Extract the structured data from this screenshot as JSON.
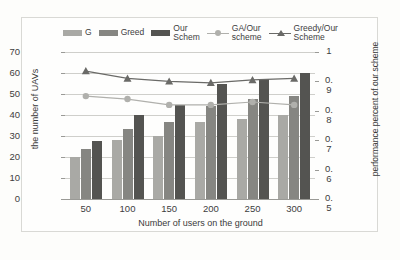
{
  "legend": {
    "items": [
      {
        "label": "G",
        "type": "bar",
        "color": "#a9a9a5",
        "name": "legend-item-g"
      },
      {
        "label": "Greed",
        "type": "bar",
        "color": "#868682",
        "name": "legend-item-greed"
      },
      {
        "label": "Our\nSchem",
        "type": "bar",
        "color": "#545451",
        "name": "legend-item-our-schem"
      },
      {
        "label": "GA/Our\nscheme",
        "type": "line-circle",
        "color": "#b0b0ac",
        "name": "legend-item-ga-our-scheme"
      },
      {
        "label": "Greedy/Our\nScheme",
        "type": "line-triangle",
        "color": "#6a6a67",
        "name": "legend-item-greedy-our-scheme"
      }
    ]
  },
  "axes": {
    "y_left_title": "the number of UAVs",
    "y_right_title": "performance percent of our scheme",
    "x_title": "Number of users on the ground",
    "y_left_ticks": [
      "70",
      "60",
      "50",
      "40",
      "30",
      "20",
      "10",
      "0"
    ],
    "y_right_ticks": [
      "1",
      "0.\n9",
      "0.\n8",
      "0.\n7",
      "0.\n6",
      "0.\n5"
    ],
    "x_ticks": [
      "50",
      "100",
      "150",
      "200",
      "250",
      "300"
    ]
  },
  "chart_data": {
    "type": "bar",
    "title": "",
    "xlabel": "Number of users on the ground",
    "ylabel": "the number of UAVs",
    "y2label": "performance percent of our scheme",
    "categories": [
      "50",
      "100",
      "150",
      "200",
      "250",
      "300"
    ],
    "ylim": [
      0,
      70
    ],
    "y2lim": [
      0.5,
      1.0
    ],
    "grid": true,
    "legend_position": "top",
    "series": [
      {
        "name": "G",
        "type": "bar",
        "axis": "left",
        "color": "#a9a9a5",
        "values": [
          20,
          28,
          30,
          36.5,
          38,
          40
        ]
      },
      {
        "name": "Greed",
        "type": "bar",
        "axis": "left",
        "color": "#868682",
        "values": [
          24,
          33.5,
          36.5,
          44.5,
          47.5,
          49
        ]
      },
      {
        "name": "Our Schem",
        "type": "bar",
        "axis": "left",
        "color": "#545451",
        "values": [
          27.5,
          40,
          45,
          55,
          57,
          60
        ]
      },
      {
        "name": "GA/Our scheme",
        "type": "line",
        "axis": "right",
        "marker": "circle",
        "color": "#b0b0ac",
        "values": [
          0.85,
          0.84,
          0.82,
          0.82,
          0.83,
          0.82
        ]
      },
      {
        "name": "Greedy/Our Scheme",
        "type": "line",
        "axis": "right",
        "marker": "triangle",
        "color": "#6a6a67",
        "values": [
          0.935,
          0.91,
          0.9,
          0.895,
          0.905,
          0.91
        ]
      }
    ]
  }
}
